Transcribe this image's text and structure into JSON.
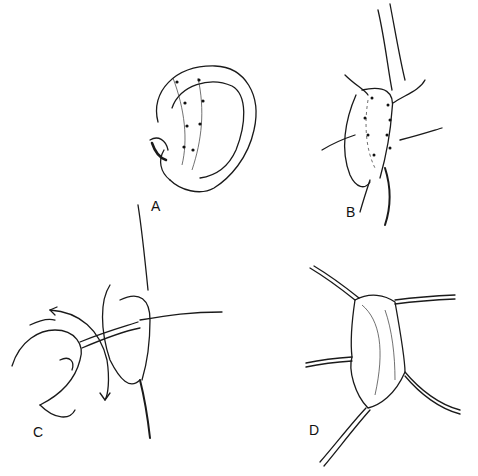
{
  "figure": {
    "panels": [
      {
        "id": "A",
        "label": "A",
        "description": "external ear with dotted incision lines on scapha/helix"
      },
      {
        "id": "B",
        "label": "B",
        "description": "posterior incision retracted with hooks, dotted suture line exposed"
      },
      {
        "id": "C",
        "label": "C",
        "description": "hand manipulating instrument through incision, curved arrows showing motion"
      },
      {
        "id": "D",
        "label": "D",
        "description": "opened wound retracted by four hooks, cartilage sutures placed"
      }
    ]
  }
}
